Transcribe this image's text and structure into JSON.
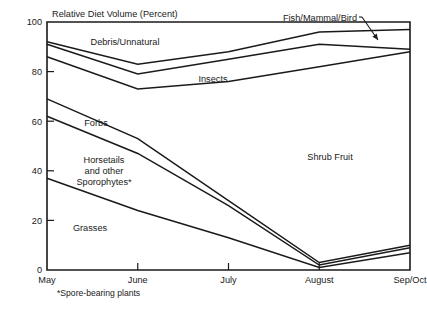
{
  "chart_data": {
    "type": "area",
    "title": "",
    "ylabel": "Relative Diet Volume (Percent)",
    "xlabel": "",
    "ylim": [
      0,
      100
    ],
    "grid": false,
    "legend": "inline-region-labels",
    "categories": [
      "May",
      "June",
      "July",
      "August",
      "Sep/Oct"
    ],
    "y_ticks": [
      "0",
      "20",
      "40",
      "60",
      "80",
      "100"
    ],
    "y_tick_values": [
      0,
      20,
      40,
      60,
      80,
      100
    ],
    "boundaries": [
      {
        "name": "grasses-top",
        "values": [
          37,
          24,
          13,
          1,
          7
        ]
      },
      {
        "name": "horsetails-top",
        "values": [
          62,
          47,
          26,
          2,
          9
        ]
      },
      {
        "name": "forbs-top",
        "values": [
          69,
          53,
          28,
          3,
          10
        ]
      },
      {
        "name": "shrub-fruit-top",
        "values": [
          86,
          73,
          76,
          82,
          88
        ]
      },
      {
        "name": "insects-top",
        "values": [
          91,
          79,
          85,
          91,
          89
        ]
      },
      {
        "name": "debris-top",
        "values": [
          92,
          83,
          88,
          96,
          97
        ]
      }
    ],
    "series": [
      {
        "name": "Grasses",
        "values": [
          37,
          24,
          13,
          1,
          7
        ]
      },
      {
        "name": "Horsetails and other Sporophytes*",
        "values": [
          25,
          23,
          13,
          1,
          2
        ]
      },
      {
        "name": "Forbs",
        "values": [
          7,
          6,
          2,
          1,
          1
        ]
      },
      {
        "name": "Shrub Fruit",
        "values": [
          17,
          20,
          48,
          79,
          78
        ]
      },
      {
        "name": "Insects",
        "values": [
          5,
          6,
          9,
          9,
          1
        ]
      },
      {
        "name": "Debris/Unnatural",
        "values": [
          1,
          4,
          3,
          5,
          8
        ]
      },
      {
        "name": "Fish/Mammal/Bird",
        "values": [
          8,
          17,
          12,
          4,
          3
        ]
      }
    ],
    "region_labels": [
      {
        "name": "debris-unnatural",
        "text": "Debris/Unnatural",
        "x": 125,
        "y": 45
      },
      {
        "name": "insects",
        "text": "Insects",
        "x": 213,
        "y": 82
      },
      {
        "name": "forbs",
        "text": "Forbs",
        "x": 96,
        "y": 126
      },
      {
        "name": "horsetails",
        "text": "Horsetails",
        "x": 104,
        "y": 163
      },
      {
        "name": "horsetails-line2",
        "text": "and other",
        "x": 104,
        "y": 174
      },
      {
        "name": "horsetails-line3",
        "text": "Sporophytes*",
        "x": 104,
        "y": 185
      },
      {
        "name": "grasses",
        "text": "Grasses",
        "x": 90,
        "y": 231
      },
      {
        "name": "shrub-fruit",
        "text": "Shrub Fruit",
        "x": 330,
        "y": 160
      }
    ],
    "annotations": [
      {
        "name": "fish-mammal-bird",
        "text": "Fish/Mammal/Bird",
        "text_x": 357,
        "text_y": 21,
        "leader": {
          "x1": 362,
          "y1": 17,
          "x2": 378,
          "y2": 40
        }
      }
    ],
    "footnote": "*Spore-bearing plants",
    "footnote_x": 57,
    "footnote_y": 296,
    "axis_title_x": 52,
    "axis_title_y": 17,
    "colors": {
      "line": "#1a1a1a",
      "axis": "#1a1a1a",
      "background": "#ffffff",
      "text": "#1a1a1a"
    },
    "plot_geometry": {
      "left": 47,
      "right": 410,
      "top": 22,
      "bottom": 270
    }
  }
}
